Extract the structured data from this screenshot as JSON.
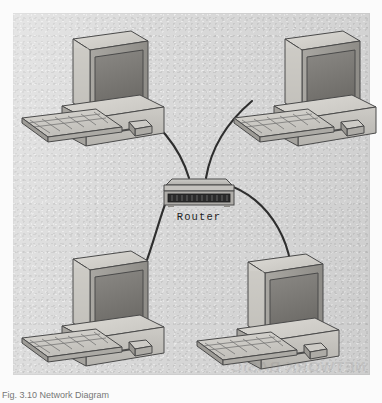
{
  "figure": {
    "caption": "Fig. 3.10  Network Diagram",
    "watermark": "NETWORK BASIC",
    "background_color": "#dadada",
    "page_color": "#fbfbfb"
  },
  "devices": {
    "router": {
      "label": "Router",
      "type": "router",
      "body_color": "#b9b9b9",
      "port_strip_color": "#2b2b2b"
    },
    "computers": [
      {
        "id": "pc-top-left",
        "label": "",
        "type": "desktop-computer",
        "position": "top-left"
      },
      {
        "id": "pc-top-right",
        "label": "",
        "type": "desktop-computer",
        "position": "top-right"
      },
      {
        "id": "pc-bottom-left",
        "label": "",
        "type": "desktop-computer",
        "position": "bottom-left"
      },
      {
        "id": "pc-bottom-right",
        "label": "",
        "type": "desktop-computer",
        "position": "bottom-right"
      }
    ]
  },
  "connections": [
    {
      "from": "pc-top-left",
      "to": "router"
    },
    {
      "from": "pc-top-right",
      "to": "router"
    },
    {
      "from": "pc-bottom-left",
      "to": "router"
    },
    {
      "from": "pc-bottom-right",
      "to": "router"
    }
  ],
  "colors": {
    "case_light": "#cfcdc8",
    "case_mid": "#b6b4af",
    "case_dark": "#95938e",
    "screen": "#7c7a76",
    "outline": "#4a4a4a",
    "cable": "#2e2e2e"
  }
}
